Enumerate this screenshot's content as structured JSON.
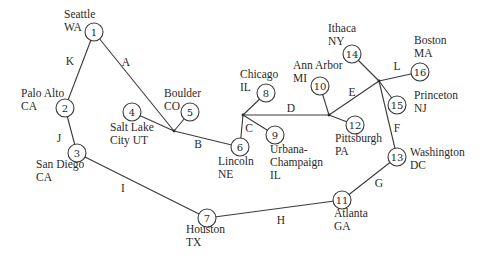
{
  "diagram": {
    "type": "network-graph",
    "nodes": [
      {
        "id": "1",
        "x": 94,
        "y": 32,
        "name": "Seattle",
        "state": "WA",
        "lx": 64,
        "ly": 18,
        "anchor": "start"
      },
      {
        "id": "2",
        "x": 65,
        "y": 108,
        "name": "Palo Alto",
        "state": "CA",
        "lx": 21,
        "ly": 97,
        "anchor": "start"
      },
      {
        "id": "3",
        "x": 77,
        "y": 153,
        "name": "San Diego",
        "state": "CA",
        "lx": 36,
        "ly": 168,
        "anchor": "start"
      },
      {
        "id": "4",
        "x": 132,
        "y": 112,
        "name": "Salt Lake",
        "state": "City UT",
        "lx": 110,
        "ly": 131,
        "anchor": "start"
      },
      {
        "id": "5",
        "x": 190,
        "y": 112,
        "name": "Boulder",
        "state": "CO",
        "lx": 164,
        "ly": 97,
        "anchor": "start"
      },
      {
        "id": "6",
        "x": 240,
        "y": 147,
        "name": "Lincoln",
        "state": "NE",
        "lx": 218,
        "ly": 165,
        "anchor": "start"
      },
      {
        "id": "7",
        "x": 207,
        "y": 218,
        "name": "Houston",
        "state": "TX",
        "lx": 186,
        "ly": 233,
        "anchor": "start"
      },
      {
        "id": "8",
        "x": 266,
        "y": 93,
        "name": "Chicago",
        "state": "IL",
        "lx": 240,
        "ly": 78,
        "anchor": "start"
      },
      {
        "id": "9",
        "x": 275,
        "y": 135,
        "name": "Urbana-",
        "state": "Champaign",
        "state2": "IL",
        "lx": 270,
        "ly": 153,
        "anchor": "start"
      },
      {
        "id": "10",
        "x": 320,
        "y": 86,
        "name": "Ann Arbor",
        "state": "MI",
        "lx": 293,
        "ly": 69,
        "anchor": "start"
      },
      {
        "id": "11",
        "x": 342,
        "y": 200,
        "name": "Atlanta",
        "state": "GA",
        "lx": 334,
        "ly": 217,
        "anchor": "start"
      },
      {
        "id": "12",
        "x": 355,
        "y": 125,
        "name": "Pittsburgh",
        "state": "PA",
        "lx": 335,
        "ly": 142,
        "anchor": "start"
      },
      {
        "id": "13",
        "x": 397,
        "y": 157,
        "name": "Washington",
        "state": "DC",
        "lx": 410,
        "ly": 156,
        "anchor": "start"
      },
      {
        "id": "14",
        "x": 352,
        "y": 54,
        "name": "Ithaca",
        "state": "NY",
        "lx": 328,
        "ly": 32,
        "anchor": "start"
      },
      {
        "id": "15",
        "x": 397,
        "y": 105,
        "name": "Princeton",
        "state": "NJ",
        "lx": 414,
        "ly": 99,
        "anchor": "start"
      },
      {
        "id": "16",
        "x": 420,
        "y": 72,
        "name": "Boston",
        "state": "MA",
        "lx": 414,
        "ly": 44,
        "anchor": "start"
      }
    ],
    "junctions": [
      {
        "id": "j_slc",
        "x": 174,
        "y": 131
      },
      {
        "id": "j_chi",
        "x": 243,
        "y": 115
      },
      {
        "id": "j_pit",
        "x": 329,
        "y": 115
      },
      {
        "id": "j_ne",
        "x": 379,
        "y": 81
      }
    ],
    "segments": [
      {
        "from": "1",
        "to": "2"
      },
      {
        "from": "1",
        "to": "j_slc"
      },
      {
        "from": "2",
        "to": "3"
      },
      {
        "from": "3",
        "to": "7"
      },
      {
        "from": "4",
        "to": "j_slc"
      },
      {
        "from": "5",
        "to": "j_slc"
      },
      {
        "from": "j_slc",
        "to": "6"
      },
      {
        "from": "6",
        "to": "j_chi"
      },
      {
        "from": "8",
        "to": "j_chi"
      },
      {
        "from": "9",
        "to": "j_chi"
      },
      {
        "from": "j_chi",
        "to": "j_pit"
      },
      {
        "from": "10",
        "to": "j_pit"
      },
      {
        "from": "12",
        "to": "j_pit"
      },
      {
        "from": "j_pit",
        "to": "j_ne"
      },
      {
        "from": "14",
        "to": "j_ne"
      },
      {
        "from": "16",
        "to": "j_ne"
      },
      {
        "from": "15",
        "to": "j_ne"
      },
      {
        "from": "j_ne",
        "to": "13"
      },
      {
        "from": "13",
        "to": "11"
      },
      {
        "from": "11",
        "to": "7"
      }
    ],
    "edge_labels": [
      {
        "label": "A",
        "x": 126,
        "y": 62
      },
      {
        "label": "B",
        "x": 198,
        "y": 144
      },
      {
        "label": "C",
        "x": 249,
        "y": 128
      },
      {
        "label": "D",
        "x": 291,
        "y": 108
      },
      {
        "label": "E",
        "x": 352,
        "y": 92
      },
      {
        "label": "F",
        "x": 397,
        "y": 128
      },
      {
        "label": "G",
        "x": 379,
        "y": 183
      },
      {
        "label": "H",
        "x": 281,
        "y": 220
      },
      {
        "label": "I",
        "x": 123,
        "y": 188
      },
      {
        "label": "J",
        "x": 59,
        "y": 138
      },
      {
        "label": "K",
        "x": 70,
        "y": 61
      },
      {
        "label": "L",
        "x": 397,
        "y": 66
      }
    ]
  }
}
